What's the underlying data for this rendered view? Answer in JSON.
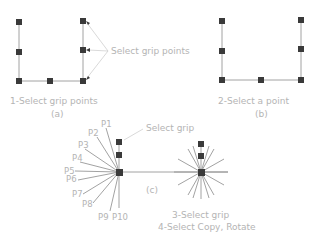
{
  "panel_a": {
    "callout": "Select grip points",
    "caption": "1-Select grip points",
    "label": "(a)"
  },
  "panel_b": {
    "caption": "2-Select a point",
    "label": "(b)"
  },
  "panel_c": {
    "callout": "Select grip",
    "label": "(c)",
    "caption_1": "3-Select grip",
    "caption_2": "4-Select Copy, Rotate",
    "points": [
      "P1",
      "P2",
      "P3",
      "P4",
      "P5",
      "P6",
      "P7",
      "P8",
      "P9",
      "P10"
    ]
  },
  "colors": {
    "grip": "#3a3a3a",
    "line": "#8a8a8a",
    "text": "#b4b4b4"
  }
}
